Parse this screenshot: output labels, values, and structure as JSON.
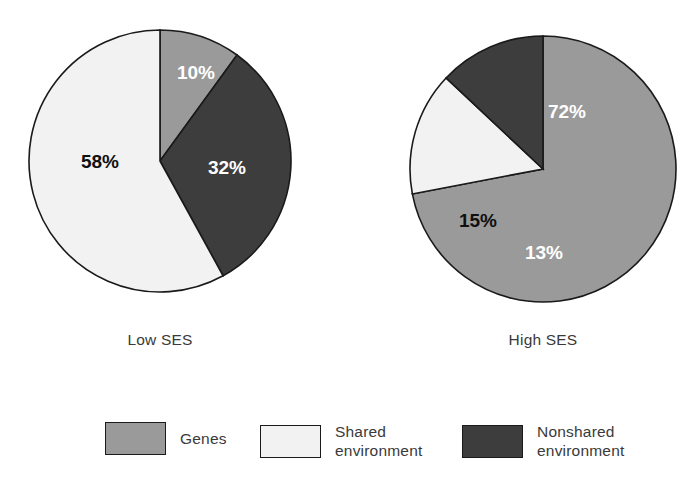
{
  "figure": {
    "background": "#ffffff",
    "stroke_color": "#1a1a1a"
  },
  "colors": {
    "genes": "#9a9a9a",
    "shared_environment": "#f2f2f2",
    "nonshared_environment": "#3d3d3d"
  },
  "captions": {
    "left": "Low SES",
    "right": "High SES"
  },
  "legend": {
    "items": [
      {
        "label": "Genes",
        "color": "#9a9a9a",
        "key": "genes"
      },
      {
        "label": "Shared\nenvironment",
        "color": "#f2f2f2",
        "key": "shared_environment"
      },
      {
        "label": "Nonshared\nenvironment",
        "color": "#3d3d3d",
        "key": "nonshared_environment"
      }
    ]
  },
  "chart_data": {
    "type": "pie",
    "title": "",
    "xlabel": "",
    "ylabel": "",
    "legend_position": "bottom",
    "grid": false,
    "units": "percent",
    "categories": [
      "Genes",
      "Shared environment",
      "Nonshared environment"
    ],
    "colors": [
      "#9a9a9a",
      "#f2f2f2",
      "#3d3d3d"
    ],
    "charts": [
      {
        "name": "Low SES",
        "label": "Low SES",
        "center": [
          160,
          161
        ],
        "radius": 131,
        "start_angle_deg": 0,
        "direction": "clockwise",
        "slices": [
          {
            "category": "Genes",
            "value": 10,
            "label": "10%",
            "color": "#9a9a9a",
            "text_color": "#ffffff",
            "label_xy": [
              196,
              74
            ]
          },
          {
            "category": "Nonshared environment",
            "value": 32,
            "label": "32%",
            "color": "#3d3d3d",
            "text_color": "#ffffff",
            "label_xy": [
              227,
              169
            ]
          },
          {
            "category": "Shared environment",
            "value": 58,
            "label": "58%",
            "color": "#f2f2f2",
            "text_color": "#101010",
            "label_xy": [
              100,
              163
            ]
          }
        ]
      },
      {
        "name": "High SES",
        "label": "High SES",
        "center": [
          543,
          169
        ],
        "radius": 133,
        "start_angle_deg": 0,
        "direction": "clockwise",
        "slices": [
          {
            "category": "Genes",
            "value": 72,
            "label": "72%",
            "color": "#9a9a9a",
            "text_color": "#ffffff",
            "label_xy": [
              567,
              113
            ]
          },
          {
            "category": "Shared environment",
            "value": 15,
            "label": "15%",
            "color": "#f2f2f2",
            "text_color": "#101010",
            "label_xy": [
              478,
              222
            ]
          },
          {
            "category": "Nonshared environment",
            "value": 13,
            "label": "13%",
            "color": "#3d3d3d",
            "text_color": "#ffffff",
            "label_xy": [
              544,
              254
            ]
          }
        ]
      }
    ]
  },
  "layout": {
    "caption_left_xy": [
      160,
      331
    ],
    "caption_right_xy": [
      543,
      331
    ],
    "legend_item_x": [
      105,
      260,
      462
    ],
    "legend_top": 8
  }
}
